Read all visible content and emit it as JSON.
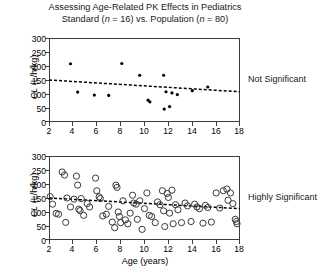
{
  "title": {
    "line1_a": "Assessing Age-Related PK Effects in Pediatrics",
    "line2_a": "Standard (",
    "line2_n1": "n",
    "line2_b": " = 16) vs. Population (",
    "line2_n2": "n",
    "line2_c": " = 80)"
  },
  "axes": {
    "y_label_a": "CL",
    "y_label_b": " (L/h/kg)",
    "x_label": "Age (years)",
    "y_ticks": [
      "0",
      "50",
      "100",
      "150",
      "200",
      "250",
      "300"
    ],
    "x_ticks": [
      "2",
      "4",
      "6",
      "8",
      "10",
      "12",
      "14",
      "16",
      "18"
    ]
  },
  "annotations": {
    "top": "Not Significant",
    "bottom": "Highly Significant"
  },
  "colors": {
    "axis": "#3c3c3c",
    "marker_filled": "#000000",
    "marker_open": "#3a3a3a",
    "fit_line": "#000000",
    "text": "#1a1a1a"
  },
  "chart_data": [
    {
      "type": "scatter",
      "panel": "top",
      "title": "Standard (n = 16)",
      "xlabel": "",
      "ylabel": "CL (L/h/kg)",
      "xlim": [
        2,
        18
      ],
      "ylim": [
        0,
        300
      ],
      "xticks": [
        2,
        4,
        6,
        8,
        10,
        12,
        14,
        16,
        18
      ],
      "yticks": [
        0,
        50,
        100,
        150,
        200,
        250,
        300
      ],
      "grid": false,
      "legend": false,
      "marker": "filled-circle",
      "n": 16,
      "annotation": "Not Significant",
      "points": [
        {
          "x": 3.8,
          "y": 208
        },
        {
          "x": 4.4,
          "y": 107
        },
        {
          "x": 5.8,
          "y": 96
        },
        {
          "x": 7.0,
          "y": 95
        },
        {
          "x": 8.1,
          "y": 209
        },
        {
          "x": 9.6,
          "y": 167
        },
        {
          "x": 10.3,
          "y": 78
        },
        {
          "x": 10.45,
          "y": 72
        },
        {
          "x": 11.6,
          "y": 167
        },
        {
          "x": 11.65,
          "y": 46
        },
        {
          "x": 11.8,
          "y": 108
        },
        {
          "x": 12.1,
          "y": 55
        },
        {
          "x": 12.3,
          "y": 104
        },
        {
          "x": 12.75,
          "y": 98
        },
        {
          "x": 14.0,
          "y": 112
        },
        {
          "x": 15.3,
          "y": 125
        }
      ],
      "fit_line": {
        "x0": 2,
        "y0": 150,
        "x1": 18,
        "y1": 108,
        "style": "dashed"
      }
    },
    {
      "type": "scatter",
      "panel": "bottom",
      "title": "Population (n = 80)",
      "xlabel": "Age (years)",
      "ylabel": "CL (L/h/kg)",
      "xlim": [
        2,
        18
      ],
      "ylim": [
        0,
        300
      ],
      "xticks": [
        2,
        4,
        6,
        8,
        10,
        12,
        14,
        16,
        18
      ],
      "yticks": [
        0,
        50,
        100,
        150,
        200,
        250,
        300
      ],
      "grid": false,
      "legend": false,
      "marker": "open-circle",
      "n": 80,
      "annotation": "Highly Significant",
      "points": [
        {
          "x": 2.1,
          "y": 155
        },
        {
          "x": 2.3,
          "y": 128
        },
        {
          "x": 2.6,
          "y": 95
        },
        {
          "x": 2.8,
          "y": 92
        },
        {
          "x": 3.1,
          "y": 243
        },
        {
          "x": 3.3,
          "y": 232
        },
        {
          "x": 3.4,
          "y": 63
        },
        {
          "x": 3.5,
          "y": 150
        },
        {
          "x": 3.8,
          "y": 118
        },
        {
          "x": 4.1,
          "y": 146
        },
        {
          "x": 4.3,
          "y": 228
        },
        {
          "x": 4.4,
          "y": 196
        },
        {
          "x": 4.5,
          "y": 110
        },
        {
          "x": 4.6,
          "y": 105
        },
        {
          "x": 4.7,
          "y": 148
        },
        {
          "x": 4.9,
          "y": 88
        },
        {
          "x": 5.2,
          "y": 130
        },
        {
          "x": 5.4,
          "y": 118
        },
        {
          "x": 5.9,
          "y": 221
        },
        {
          "x": 6.0,
          "y": 176
        },
        {
          "x": 6.2,
          "y": 154
        },
        {
          "x": 6.3,
          "y": 148
        },
        {
          "x": 6.5,
          "y": 86
        },
        {
          "x": 6.8,
          "y": 92
        },
        {
          "x": 7.0,
          "y": 120
        },
        {
          "x": 7.3,
          "y": 64
        },
        {
          "x": 7.5,
          "y": 44
        },
        {
          "x": 7.6,
          "y": 196
        },
        {
          "x": 7.7,
          "y": 188
        },
        {
          "x": 7.8,
          "y": 100
        },
        {
          "x": 7.9,
          "y": 84
        },
        {
          "x": 8.0,
          "y": 62
        },
        {
          "x": 8.2,
          "y": 140
        },
        {
          "x": 8.4,
          "y": 72
        },
        {
          "x": 8.6,
          "y": 58
        },
        {
          "x": 8.8,
          "y": 96
        },
        {
          "x": 9.0,
          "y": 160
        },
        {
          "x": 9.1,
          "y": 132
        },
        {
          "x": 9.3,
          "y": 128
        },
        {
          "x": 9.4,
          "y": 74
        },
        {
          "x": 9.6,
          "y": 140
        },
        {
          "x": 9.8,
          "y": 38
        },
        {
          "x": 10.0,
          "y": 112
        },
        {
          "x": 10.2,
          "y": 168
        },
        {
          "x": 10.4,
          "y": 88
        },
        {
          "x": 10.6,
          "y": 84
        },
        {
          "x": 10.9,
          "y": 62
        },
        {
          "x": 11.1,
          "y": 136
        },
        {
          "x": 11.3,
          "y": 126
        },
        {
          "x": 11.5,
          "y": 176
        },
        {
          "x": 11.6,
          "y": 104
        },
        {
          "x": 11.7,
          "y": 48
        },
        {
          "x": 11.9,
          "y": 166
        },
        {
          "x": 12.0,
          "y": 152
        },
        {
          "x": 12.1,
          "y": 96
        },
        {
          "x": 12.3,
          "y": 178
        },
        {
          "x": 12.4,
          "y": 58
        },
        {
          "x": 12.6,
          "y": 126
        },
        {
          "x": 12.8,
          "y": 108
        },
        {
          "x": 13.1,
          "y": 62
        },
        {
          "x": 13.4,
          "y": 132
        },
        {
          "x": 13.6,
          "y": 122
        },
        {
          "x": 13.9,
          "y": 66
        },
        {
          "x": 14.2,
          "y": 128
        },
        {
          "x": 14.4,
          "y": 118
        },
        {
          "x": 14.6,
          "y": 112
        },
        {
          "x": 14.9,
          "y": 60
        },
        {
          "x": 15.1,
          "y": 124
        },
        {
          "x": 15.3,
          "y": 116
        },
        {
          "x": 15.6,
          "y": 64
        },
        {
          "x": 16.0,
          "y": 168
        },
        {
          "x": 16.3,
          "y": 114
        },
        {
          "x": 16.6,
          "y": 176
        },
        {
          "x": 16.9,
          "y": 182
        },
        {
          "x": 17.0,
          "y": 142
        },
        {
          "x": 17.2,
          "y": 168
        },
        {
          "x": 17.4,
          "y": 130
        },
        {
          "x": 17.6,
          "y": 74
        },
        {
          "x": 17.7,
          "y": 66
        },
        {
          "x": 17.75,
          "y": 58
        }
      ],
      "fit_line": {
        "x0": 2,
        "y0": 150,
        "x1": 18,
        "y1": 112,
        "style": "dashed"
      }
    }
  ]
}
